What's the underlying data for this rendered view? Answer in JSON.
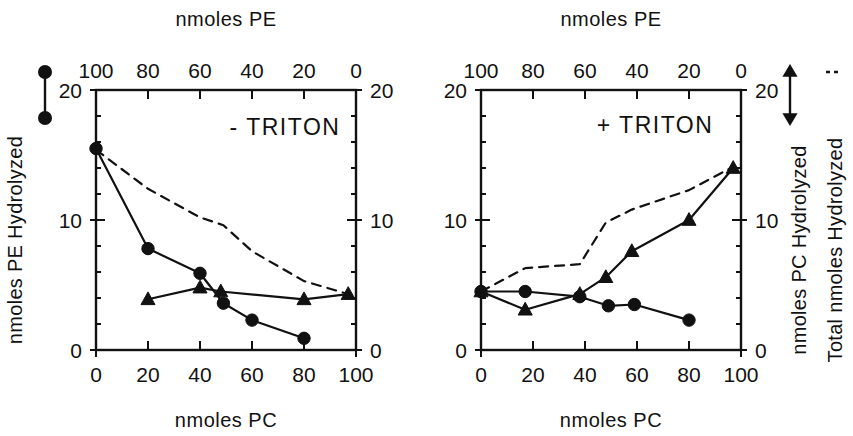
{
  "figure": {
    "background": "#ffffff",
    "ink": "#111111"
  },
  "chart_data": [
    {
      "type": "line",
      "panel_id": "left",
      "title": "- TRITON",
      "xlabel": "nmoles PC",
      "xlabel_top": "nmoles PE",
      "ylabel_left": "nmoles PE Hydrolyzed",
      "xlim": [
        0,
        100
      ],
      "ylim": [
        0,
        20
      ],
      "ylim_right": [
        0,
        20
      ],
      "xticks": [
        0,
        20,
        40,
        60,
        80,
        100
      ],
      "xticklabels": [
        "0",
        "20",
        "40",
        "60",
        "80",
        "100"
      ],
      "xticks_top": [
        100,
        80,
        60,
        40,
        20,
        0
      ],
      "xticklabels_top": [
        "100",
        "80",
        "60",
        "40",
        "20",
        "0"
      ],
      "yticks": [
        0,
        10,
        20
      ],
      "yticklabels": [
        "0",
        "10",
        "20"
      ],
      "yticklabels_right": [
        "0",
        "10",
        "20"
      ],
      "minor_tick_step": 2,
      "grid": false,
      "series": [
        {
          "name": "nmoles PE Hydrolyzed",
          "marker": "circle",
          "linestyle": "solid",
          "x": [
            0,
            20,
            40,
            49,
            60,
            80
          ],
          "y": [
            15.5,
            7.8,
            5.9,
            3.6,
            2.3,
            0.9
          ]
        },
        {
          "name": "nmoles PC Hydrolyzed",
          "marker": "triangle",
          "linestyle": "solid",
          "x": [
            20,
            40,
            48,
            80,
            97
          ],
          "y": [
            3.9,
            4.8,
            4.5,
            3.9,
            4.3
          ]
        },
        {
          "name": "Total nmoles Hydrolyzed",
          "marker": "none",
          "linestyle": "dashed",
          "x": [
            0,
            20,
            40,
            49,
            60,
            80,
            97
          ],
          "y": [
            15.4,
            12.4,
            10.2,
            9.6,
            7.6,
            5.3,
            4.3
          ]
        }
      ]
    },
    {
      "type": "line",
      "panel_id": "right",
      "title": "+ TRITON",
      "xlabel": "nmoles PC",
      "xlabel_top": "nmoles PE",
      "ylabel_right_inner": "nmoles PC Hydrolyzed",
      "ylabel_right_outer": "Total nmoles Hydrolyzed",
      "xlim": [
        0,
        100
      ],
      "ylim": [
        0,
        20
      ],
      "ylim_right": [
        0,
        20
      ],
      "xticks": [
        0,
        20,
        40,
        60,
        80,
        100
      ],
      "xticklabels": [
        "0",
        "20",
        "40",
        "60",
        "80",
        "100"
      ],
      "xticks_top": [
        100,
        80,
        60,
        40,
        20,
        0
      ],
      "xticklabels_top": [
        "100",
        "80",
        "60",
        "40",
        "20",
        "0"
      ],
      "yticks": [
        0,
        10,
        20
      ],
      "yticklabels": [
        "0",
        "10",
        "20"
      ],
      "yticklabels_right": [
        "0",
        "10",
        "20"
      ],
      "minor_tick_step": 2,
      "grid": false,
      "series": [
        {
          "name": "nmoles PE Hydrolyzed",
          "marker": "circle",
          "linestyle": "solid",
          "x": [
            0,
            17,
            38,
            49,
            59,
            80
          ],
          "y": [
            4.5,
            4.5,
            4.1,
            3.4,
            3.5,
            2.3
          ]
        },
        {
          "name": "nmoles PC Hydrolyzed",
          "marker": "triangle",
          "linestyle": "solid",
          "x": [
            0,
            17,
            38,
            48,
            58,
            80,
            97
          ],
          "y": [
            4.5,
            3.1,
            4.3,
            5.6,
            7.6,
            10.0,
            14.0
          ]
        },
        {
          "name": "Total nmoles Hydrolyzed",
          "marker": "none",
          "linestyle": "dashed",
          "x": [
            0,
            17,
            38,
            48,
            58,
            80,
            97
          ],
          "y": [
            4.5,
            6.3,
            6.6,
            9.8,
            10.8,
            12.3,
            14.1
          ]
        }
      ]
    }
  ],
  "legends": {
    "left_panel": {
      "marker": "circle",
      "linestyle": "solid",
      "label": "nmoles PE Hydrolyzed"
    },
    "right_panel_inner": {
      "marker": "triangle",
      "linestyle": "solid",
      "label": "nmoles PC Hydrolyzed"
    },
    "right_panel_outer": {
      "marker": "none",
      "linestyle": "dashed",
      "label": "Total nmoles Hydrolyzed",
      "dash_glyph": "- - -"
    }
  },
  "labels": {
    "top_axis_title": "nmoles PE",
    "bottom_axis_title": "nmoles PC",
    "left_axis_title": "nmoles PE Hydrolyzed",
    "right_axis_title_inner": "nmoles PC Hydrolyzed",
    "right_axis_title_outer": "Total nmoles Hydrolyzed",
    "panel_left_title": "- TRITON",
    "panel_right_title": "+ TRITON"
  }
}
